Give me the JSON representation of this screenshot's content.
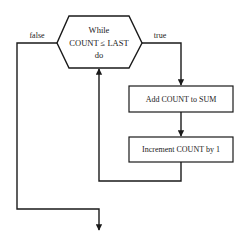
{
  "diagram": {
    "type": "flowchart",
    "decision": {
      "line1": "While",
      "line2": "COUNT ≤ LAST",
      "line3": "do"
    },
    "branches": {
      "false_label": "false",
      "true_label": "true"
    },
    "steps": [
      {
        "label": "Add COUNT to SUM"
      },
      {
        "label": "Increment COUNT by 1"
      }
    ],
    "colors": {
      "stroke": "#1a1a1a",
      "text": "#222222",
      "background": "#ffffff"
    }
  }
}
